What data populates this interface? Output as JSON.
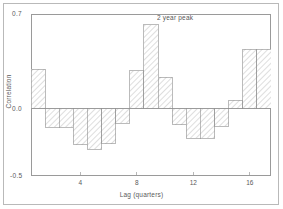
{
  "chart_data": {
    "type": "bar",
    "title": "",
    "subtitle": "",
    "xlabel": "Lag (quarters)",
    "ylabel": "Correlation",
    "xlim": [
      0.5,
      17.5
    ],
    "ylim": [
      -0.5,
      0.7
    ],
    "grid": false,
    "legend": null,
    "yticks": [
      {
        "value": 0.7,
        "label": "0.7"
      },
      {
        "value": 0.0,
        "label": "0.0"
      },
      {
        "value": -0.5,
        "label": "-0.5"
      }
    ],
    "xticks": [
      {
        "value": 4,
        "label": "4"
      },
      {
        "value": 8,
        "label": "8"
      },
      {
        "value": 12,
        "label": "12"
      },
      {
        "value": 16,
        "label": "16"
      }
    ],
    "categories": [
      1,
      2,
      3,
      4,
      5,
      6,
      7,
      8,
      9,
      10,
      11,
      12,
      13,
      14,
      15,
      16,
      17
    ],
    "values": [
      0.29,
      -0.14,
      -0.14,
      -0.27,
      -0.3,
      -0.26,
      -0.11,
      0.28,
      0.62,
      0.23,
      -0.12,
      -0.22,
      -0.22,
      -0.13,
      0.06,
      0.44,
      0.44
    ],
    "annotations": [
      {
        "text": "2 year peak",
        "x": 9,
        "y": 0.67
      }
    ],
    "style": {
      "bar_fill": "hatched",
      "hatch_color": "#c3c3c3",
      "bar_edge_color": "#8d8d8d",
      "axis_color": "#9a9a9a",
      "text_color": "#5a5a5a",
      "background": "#ffffff",
      "frame_color": "#b9b9b9"
    }
  },
  "figure": {
    "zero_line_label": "0.0",
    "top_label": "0.7",
    "bottom_label": "-0.5",
    "x_axis_title": "Lag (quarters)",
    "y_axis_title": "Correlation",
    "peak_annotation": "2 year peak"
  }
}
